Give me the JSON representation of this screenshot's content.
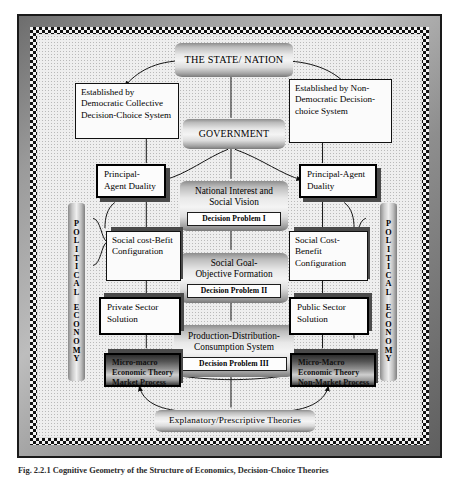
{
  "figure": {
    "caption": "Fig. 2.2.1  Cognitive Geometry of the Structure of Economics, Decision-Choice Theories"
  },
  "side_labels": {
    "left": "POLITICAL ECONOMY",
    "right": "POLITICAL ECONOMY"
  },
  "nodes": {
    "state_nation": {
      "title": "THE STATE/ NATION"
    },
    "government": {
      "title": "GOVERNMENT"
    },
    "established_democratic": {
      "text": "Established by Democratic Collective Decision-Choice System"
    },
    "established_nondemocratic": {
      "text": "Established by Non-Democratic Decision-choice System"
    },
    "principal_agent_left": {
      "text": "Principal-Agent Duality"
    },
    "principal_agent_right": {
      "text": "Principal-Agent Duality"
    },
    "national_interest": {
      "title_line1": "National Interest and",
      "title_line2": "Social Vision",
      "decision_problem": "Decision Problem I"
    },
    "social_goal": {
      "title_line1": "Social Goal-",
      "title_line2": "Objective Formation",
      "decision_problem": "Decision Problem II"
    },
    "production_system": {
      "title_line1": "Production-Distribution-",
      "title_line2": "Consumption System",
      "decision_problem": "Decision Problem III"
    },
    "social_cost_befit": {
      "text": "Social cost-Befit Configuration"
    },
    "social_cost_benefit": {
      "text": "Social Cost-Benefit Configuration"
    },
    "private_sector": {
      "text": "Private Sector Solution"
    },
    "public_sector": {
      "text": "Public Sector Solution"
    },
    "micro_macro_market": {
      "line1": "Micro-macro",
      "line2": "Economic Theory",
      "line3": "Market Process"
    },
    "micro_macro_nonmarket": {
      "line1": "Micro-Macro",
      "line2": "Economic Theory",
      "line3": "Non-Market Process"
    },
    "theories": {
      "title": "Explanatory/Prescriptive Theories"
    }
  },
  "colors": {
    "frame_border": "#1a1a1a",
    "plate_light": "#f4f4f4",
    "plate_dark": "#2e2e2e",
    "line": "#111111",
    "paper": "#eeeeee"
  }
}
